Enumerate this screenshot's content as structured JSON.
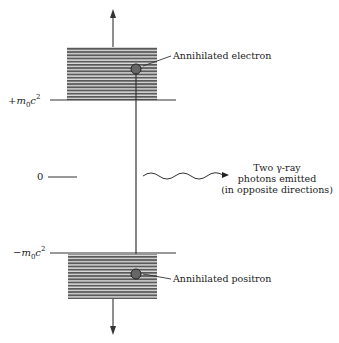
{
  "diagram": {
    "levels": {
      "positive_label_sign": "+",
      "positive_label_m": "m",
      "positive_label_sub": "0",
      "positive_label_c": "c",
      "positive_label_sup": "2",
      "zero_label": "0",
      "negative_label_sign": "−",
      "negative_label_m": "m",
      "negative_label_sub": "0",
      "negative_label_c": "c",
      "negative_label_sup": "2"
    },
    "annotations": {
      "electron": "Annihilated electron",
      "positron": "Annihilated positron",
      "photons_line1": "Two γ-ray",
      "photons_line2": "photons emitted",
      "photons_line3": "(in opposite directions)"
    },
    "colors": {
      "band_stripe": "#555555",
      "band_gap": "#d8d8d8",
      "line": "#333333",
      "particle": "#666666"
    }
  }
}
